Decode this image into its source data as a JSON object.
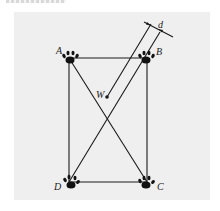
{
  "figure": {
    "background_color": "#efefef",
    "line_color": "#1a1a1a",
    "labels": {
      "A": "A",
      "B": "B",
      "C": "C",
      "D": "D",
      "W": "W",
      "d": "d"
    },
    "icons": [
      "paw-print-icon-A",
      "paw-print-icon-B",
      "paw-print-icon-C",
      "paw-print-icon-D"
    ]
  }
}
